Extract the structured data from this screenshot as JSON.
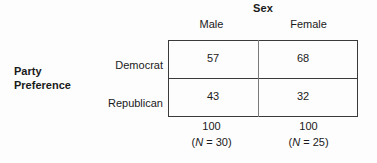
{
  "figure": {
    "column_variable": "Sex",
    "row_variable_line1": "Party",
    "row_variable_line2": "Preference",
    "column_headers": [
      "Male",
      "Female"
    ],
    "row_headers": [
      "Democrat",
      "Republican"
    ],
    "cells": [
      [
        "57",
        "68"
      ],
      [
        "43",
        "32"
      ]
    ],
    "totals": [
      "100",
      "100"
    ],
    "sample_sizes": [
      {
        "prefix": "(",
        "symbol": "N",
        "equals": " = ",
        "value": "30",
        "suffix": ")"
      },
      {
        "prefix": "(",
        "symbol": "N",
        "equals": " = ",
        "value": "25",
        "suffix": ")"
      }
    ]
  },
  "chart_data": {
    "type": "table",
    "title": "",
    "column_variable": "Sex",
    "row_variable": "Party Preference",
    "categories": [
      "Male",
      "Female"
    ],
    "rows": [
      "Democrat",
      "Republican"
    ],
    "values": [
      [
        57,
        68
      ],
      [
        43,
        32
      ]
    ],
    "column_totals": [
      100,
      100
    ],
    "column_sample_sizes": [
      30,
      25
    ],
    "units": "percent",
    "xlabel": "Sex",
    "ylabel": "Party Preference",
    "grid": true,
    "legend": "none"
  }
}
